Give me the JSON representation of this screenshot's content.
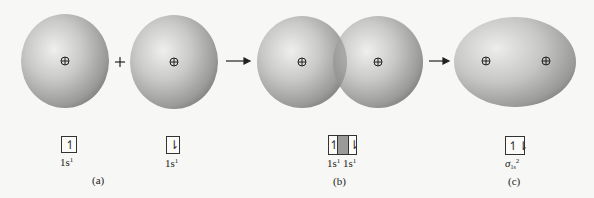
{
  "figure": {
    "panels": [
      {
        "id": "a",
        "label": "(a)"
      },
      {
        "id": "b",
        "label": "(b)"
      },
      {
        "id": "c",
        "label": "(c)"
      }
    ],
    "operators": {
      "plus": "+",
      "arrow_1": "→",
      "arrow_2": "→"
    },
    "nucleus_symbol": "⊕",
    "orbital_boxes": {
      "a1": {
        "spin": "↿",
        "label_main": "1s",
        "label_sup": "1"
      },
      "a2": {
        "spin": "⇂",
        "label_main": "1s",
        "label_sup": "1"
      },
      "b": {
        "left_spin": "↿",
        "right_spin": "⇂",
        "label_left_main": "1s",
        "label_left_sup": "1",
        "label_right_main": "1s",
        "label_right_sup": "1"
      },
      "c": {
        "spin": "↿⇂",
        "label_main": "σ",
        "label_sub": "1s",
        "label_sup": "2"
      }
    },
    "colors": {
      "sphere_light": "#e9e9e7",
      "sphere_mid": "#b9b9b7",
      "sphere_dark": "#7d7d7b",
      "overlap_shade": "#9a9a98",
      "background": "#f7f7f5"
    }
  }
}
